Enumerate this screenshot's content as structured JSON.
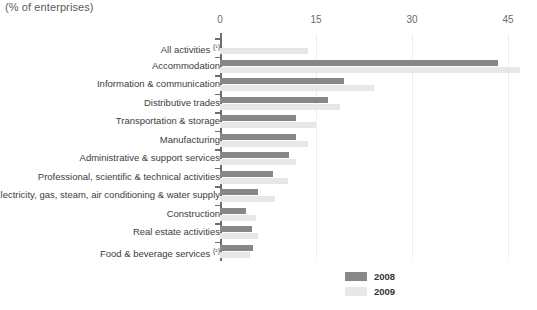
{
  "chart_data": {
    "type": "bar",
    "orientation": "horizontal",
    "title": "(% of enterprises)",
    "xlabel": "",
    "ylabel": "",
    "xlim": [
      0,
      45
    ],
    "xticks": [
      0,
      15,
      30,
      45
    ],
    "xtick_labels": [
      "0",
      "15",
      "30",
      "45"
    ],
    "grid": true,
    "grid_axis": "x",
    "legend_position": "bottom-right",
    "categories": [
      "All activities (¹)",
      "Accommodation",
      "Information & communication",
      "Distributive trades",
      "Transportation & storage",
      "Manufacturing",
      "Administrative & support services",
      "Professional, scientific & technical activities",
      "Electricity, gas, steam, air conditioning & water supply",
      "Construction",
      "Real estate activities",
      "Food & beverage services (²)"
    ],
    "series": [
      {
        "name": "2008",
        "color": "#878787",
        "values": [
          null,
          43.4,
          19.4,
          16.9,
          11.9,
          11.9,
          10.8,
          8.3,
          5.9,
          4.1,
          5.0,
          5.2
        ]
      },
      {
        "name": "2009",
        "color": "#e7e7e7",
        "values": [
          13.7,
          46.9,
          24.1,
          18.8,
          15.0,
          13.8,
          11.9,
          10.6,
          8.6,
          5.6,
          5.9,
          4.7
        ]
      }
    ]
  },
  "legend": {
    "items": [
      {
        "label": "2008",
        "color": "#878787"
      },
      {
        "label": "2009",
        "color": "#e7e7e7"
      }
    ]
  },
  "colors": {
    "series_2008": "#878787",
    "series_2009": "#e7e7e7",
    "axis": "#6e6e6e",
    "gridline": "#e2ddd5",
    "text": "#3d3d3d",
    "background": "#ffffff"
  }
}
